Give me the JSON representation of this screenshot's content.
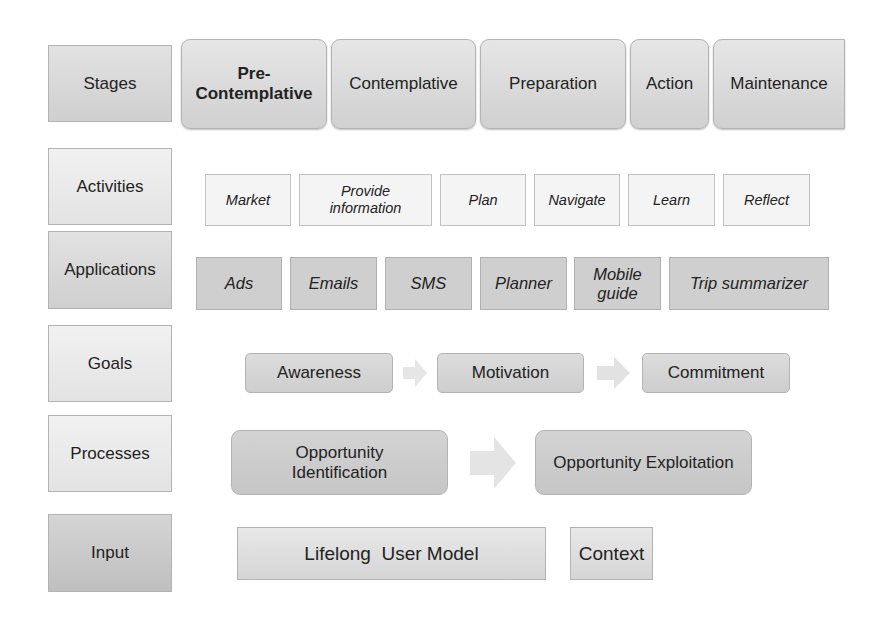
{
  "rows": {
    "stages": {
      "label": "Stages",
      "items": [
        {
          "line1": "Pre-",
          "line2": "Contemplative"
        },
        {
          "text": "Contemplative"
        },
        {
          "text": "Preparation"
        },
        {
          "text": "Action"
        },
        {
          "text": "Maintenance"
        }
      ]
    },
    "activities": {
      "label": "Activities",
      "items": [
        {
          "text": "Market"
        },
        {
          "line1": "Provide",
          "line2": "information"
        },
        {
          "text": "Plan"
        },
        {
          "text": "Navigate"
        },
        {
          "text": "Learn"
        },
        {
          "text": "Reflect"
        }
      ]
    },
    "applications": {
      "label": "Applications",
      "items": [
        {
          "text": "Ads"
        },
        {
          "text": "Emails"
        },
        {
          "text": "SMS"
        },
        {
          "text": "Planner"
        },
        {
          "line1": "Mobile",
          "line2": "guide"
        },
        {
          "text": "Trip summarizer"
        }
      ]
    },
    "goals": {
      "label": "Goals",
      "items": [
        {
          "text": "Awareness"
        },
        {
          "text": "Motivation"
        },
        {
          "text": "Commitment"
        }
      ]
    },
    "processes": {
      "label": "Processes",
      "items": [
        {
          "line1": "Opportunity",
          "line2": "Identification"
        },
        {
          "text": "Opportunity Exploitation"
        }
      ]
    },
    "input": {
      "label": "Input",
      "items": [
        {
          "text": "Lifelong  User Model"
        },
        {
          "text": "Context"
        }
      ]
    }
  },
  "colors": {
    "arrow": "#e4e4e4",
    "border": "#b3b3b3"
  }
}
